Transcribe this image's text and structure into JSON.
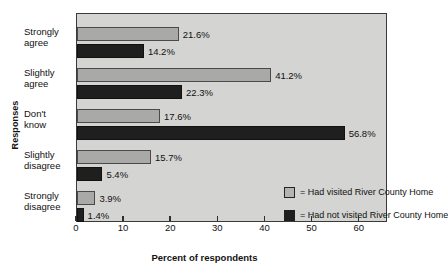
{
  "chart_data": {
    "type": "bar",
    "orientation": "horizontal",
    "title": "",
    "xlabel": "Percent of respondents",
    "ylabel": "Responses",
    "xlim": [
      0,
      66
    ],
    "xticks": [
      0,
      10,
      20,
      30,
      40,
      50,
      60
    ],
    "xtick_labels": [
      "0",
      "10",
      "20",
      "30",
      "40",
      "50",
      "60"
    ],
    "grid": false,
    "legend_position": "inside-bottom-right",
    "categories": [
      "Strongly agree",
      "Slightly agree",
      "Don't know",
      "Slightly disagree",
      "Strongly disagree"
    ],
    "category_lines": [
      [
        "Strongly",
        "agree"
      ],
      [
        "Slightly",
        "agree"
      ],
      [
        "Don't",
        "know"
      ],
      [
        "Slightly",
        "disagree"
      ],
      [
        "Strongly",
        "disagree"
      ]
    ],
    "series": [
      {
        "name": "Had visited River County Home",
        "color": "#a9a9a7",
        "values": [
          21.6,
          41.2,
          17.6,
          15.7,
          3.9
        ],
        "data_labels": [
          "21.6%",
          "41.2%",
          "17.6%",
          "15.7%",
          "3.9%"
        ]
      },
      {
        "name": "Had not visited River County Home",
        "color": "#1f1f1f",
        "values": [
          14.2,
          22.3,
          56.8,
          5.4,
          1.4
        ],
        "data_labels": [
          "14.2%",
          "22.3%",
          "56.8%",
          "5.4%",
          "1.4%"
        ]
      }
    ]
  },
  "legend": {
    "items": [
      {
        "prefix": "=",
        "label": "= Had visited River County Home",
        "swatch": "light"
      },
      {
        "prefix": "=",
        "label": "= Had not visited River County Home",
        "swatch": "dark"
      }
    ]
  },
  "colors": {
    "plot_background": "#d4d4d2",
    "page_background": "#ffffff",
    "frame": "#3a3a3a",
    "series_light": "#a9a9a7",
    "series_dark": "#1f1f1f",
    "text": "#111111"
  }
}
